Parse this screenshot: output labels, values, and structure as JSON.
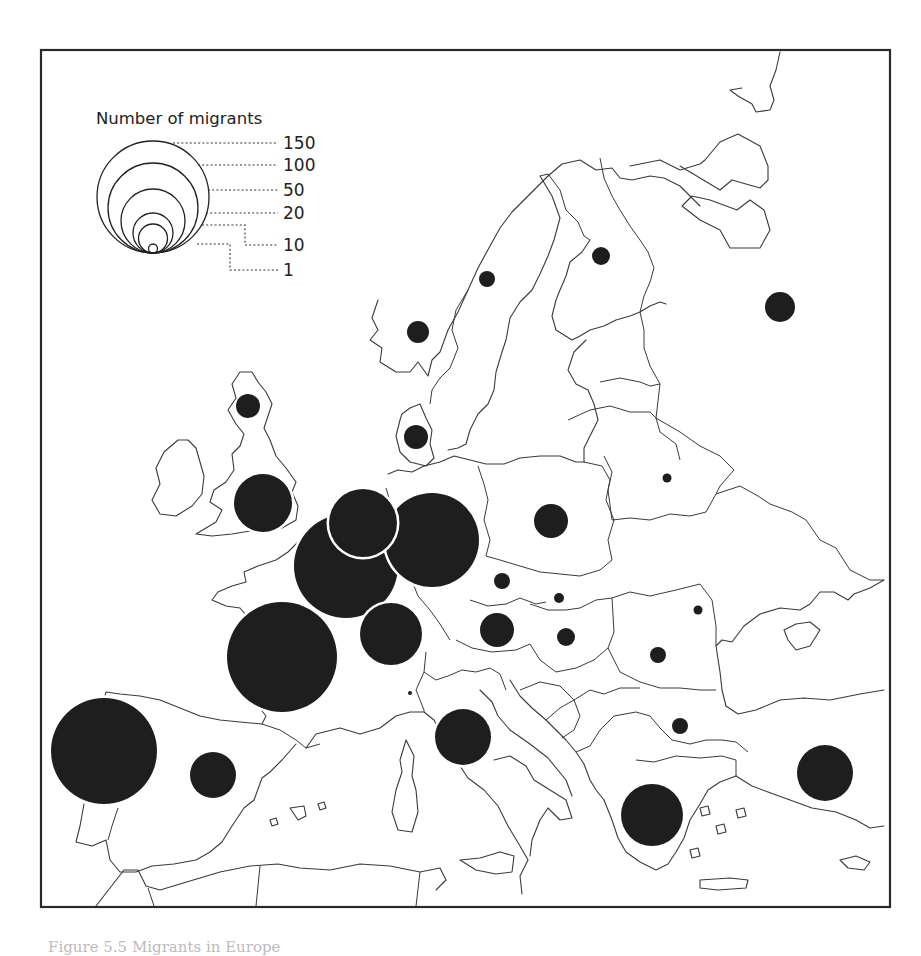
{
  "map": {
    "title": "Number of migrants",
    "frame": {
      "x": 41,
      "y": 50,
      "width": 849,
      "height": 857
    },
    "colors": {
      "bubble": "#1e1e1e",
      "line": "#3a3a3a",
      "background": "#ffffff"
    }
  },
  "legend": {
    "title": "Number of migrants",
    "anchor": {
      "cx": 153,
      "bottom": 253
    },
    "items": [
      {
        "value": "150",
        "radius": 56,
        "label_y": 149
      },
      {
        "value": "100",
        "radius": 45,
        "label_y": 171
      },
      {
        "value": "50",
        "radius": 32,
        "label_y": 196
      },
      {
        "value": "20",
        "radius": 20,
        "label_y": 219
      },
      {
        "value": "10",
        "radius": 14.5,
        "label_y": 251
      },
      {
        "value": "1",
        "radius": 4.5,
        "label_y": 276
      }
    ]
  },
  "chart_data": {
    "type": "proportional-symbol-map",
    "title": "Number of migrants",
    "legend_values": [
      150,
      100,
      50,
      20,
      10,
      1
    ],
    "symbols": [
      {
        "region": "Portugal / NW Iberia",
        "cx": 104,
        "cy": 751,
        "r": 53,
        "approx_value": 135
      },
      {
        "region": "France",
        "cx": 282,
        "cy": 657,
        "r": 55,
        "approx_value": 145
      },
      {
        "region": "Belgium",
        "cx": 346,
        "cy": 566,
        "r": 52,
        "approx_value": 130
      },
      {
        "region": "Germany",
        "cx": 432,
        "cy": 540,
        "r": 47,
        "approx_value": 110
      },
      {
        "region": "Netherlands",
        "cx": 363,
        "cy": 523,
        "r": 34,
        "approx_value": 55
      },
      {
        "region": "Luxembourg / E France",
        "cx": 391,
        "cy": 634,
        "r": 31,
        "approx_value": 48
      },
      {
        "region": "Greece",
        "cx": 652,
        "cy": 815,
        "r": 31,
        "approx_value": 48
      },
      {
        "region": "England & Wales",
        "cx": 263,
        "cy": 503,
        "r": 29,
        "approx_value": 42
      },
      {
        "region": "Italy",
        "cx": 463,
        "cy": 737,
        "r": 28,
        "approx_value": 40
      },
      {
        "region": "Turkey",
        "cx": 825,
        "cy": 773,
        "r": 28,
        "approx_value": 40
      },
      {
        "region": "Spain",
        "cx": 213,
        "cy": 775,
        "r": 23,
        "approx_value": 27
      },
      {
        "region": "Poland",
        "cx": 551,
        "cy": 521,
        "r": 17,
        "approx_value": 15
      },
      {
        "region": "Austria",
        "cx": 497,
        "cy": 630,
        "r": 17,
        "approx_value": 15
      },
      {
        "region": "Russia",
        "cx": 780,
        "cy": 307,
        "r": 15,
        "approx_value": 12
      },
      {
        "region": "Scotland",
        "cx": 248,
        "cy": 406,
        "r": 12,
        "approx_value": 8
      },
      {
        "region": "Denmark",
        "cx": 416,
        "cy": 437,
        "r": 12,
        "approx_value": 8
      },
      {
        "region": "Norway",
        "cx": 418,
        "cy": 332,
        "r": 11,
        "approx_value": 7
      },
      {
        "region": "Finland",
        "cx": 601,
        "cy": 256,
        "r": 9,
        "approx_value": 5
      },
      {
        "region": "Hungary",
        "cx": 566,
        "cy": 637,
        "r": 9,
        "approx_value": 5
      },
      {
        "region": "Sweden",
        "cx": 487,
        "cy": 279,
        "r": 8,
        "approx_value": 4
      },
      {
        "region": "Czech Republic",
        "cx": 502,
        "cy": 581,
        "r": 8,
        "approx_value": 4
      },
      {
        "region": "Romania",
        "cx": 658,
        "cy": 655,
        "r": 8,
        "approx_value": 4
      },
      {
        "region": "Bulgaria",
        "cx": 680,
        "cy": 726,
        "r": 8,
        "approx_value": 4
      },
      {
        "region": "Slovakia",
        "cx": 559,
        "cy": 598,
        "r": 5,
        "approx_value": 2
      },
      {
        "region": "Belarus",
        "cx": 667,
        "cy": 478,
        "r": 4.5,
        "approx_value": 1
      },
      {
        "region": "Moldova",
        "cx": 698,
        "cy": 610,
        "r": 4.5,
        "approx_value": 1
      },
      {
        "region": "Switzerland",
        "cx": 410,
        "cy": 693,
        "r": 2,
        "approx_value": 1
      }
    ]
  },
  "caption": {
    "text": "Figure 5.5  Migrants in Europe"
  }
}
